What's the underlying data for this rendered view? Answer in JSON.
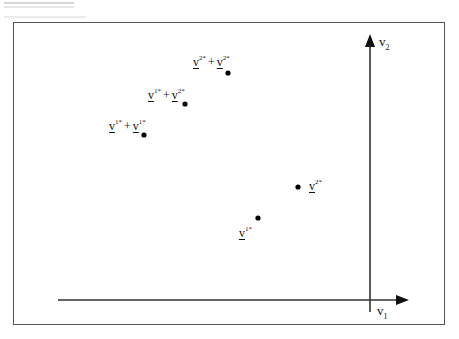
{
  "diagram": {
    "axes": {
      "x": {
        "label_base": "v",
        "label_sub": "1"
      },
      "y": {
        "label_base": "v",
        "label_sub": "2"
      }
    },
    "points": [
      {
        "id": "v1",
        "parts": [
          {
            "base": "v",
            "sup": "1*"
          }
        ],
        "dot": [
          258,
          218
        ]
      },
      {
        "id": "v2",
        "parts": [
          {
            "base": "v",
            "sup": "2*"
          }
        ],
        "dot": [
          298,
          187
        ]
      },
      {
        "id": "v1_plus_v1",
        "parts": [
          {
            "base": "v",
            "sup": "1*"
          },
          {
            "base": "v",
            "sup": "1*"
          }
        ],
        "plus": "+",
        "dot": [
          144,
          135
        ]
      },
      {
        "id": "v1_plus_v2",
        "parts": [
          {
            "base": "v",
            "sup": "1*"
          },
          {
            "base": "v",
            "sup": "2*"
          }
        ],
        "plus": "+",
        "dot": [
          185,
          104
        ]
      },
      {
        "id": "v2_plus_v2",
        "parts": [
          {
            "base": "v",
            "sup": "2*"
          },
          {
            "base": "v",
            "sup": "2*"
          }
        ],
        "plus": "+",
        "dot": [
          228,
          73
        ]
      }
    ]
  }
}
